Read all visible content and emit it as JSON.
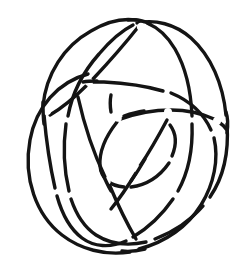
{
  "figure": {
    "kind": "knot-diagram",
    "caption": "",
    "canvas": {
      "width": 244,
      "height": 275,
      "background_color": "#ffffff"
    },
    "style": {
      "stroke_color": "#141414",
      "stroke_width": 3.4,
      "fill": "none",
      "line_cap": "round"
    },
    "bounds": {
      "left": 17,
      "top": 18,
      "right": 228,
      "bottom": 256
    },
    "loop_count": 3,
    "crossing_count": 12,
    "loops": [
      {
        "name": "loop-upper-left",
        "label": "Loop A",
        "center_x": 104,
        "center_y": 128,
        "radius_x": 78,
        "radius_y": 92,
        "rotation_deg": -28
      },
      {
        "name": "loop-right",
        "label": "Loop B",
        "center_x": 136,
        "center_y": 132,
        "radius_x": 80,
        "radius_y": 94,
        "rotation_deg": 32
      },
      {
        "name": "loop-lower",
        "label": "Loop C",
        "center_x": 120,
        "center_y": 150,
        "radius_x": 86,
        "radius_y": 80,
        "rotation_deg": 4
      }
    ],
    "crossings": [
      {
        "name": "crossing-top",
        "x": 141,
        "y": 27,
        "over": "loop-upper-left"
      },
      {
        "name": "crossing-upper-right",
        "x": 196,
        "y": 140,
        "over": "loop-right"
      },
      {
        "name": "crossing-left-upper",
        "x": 46,
        "y": 96,
        "over": "loop-lower"
      },
      {
        "name": "crossing-left-mid",
        "x": 75,
        "y": 92,
        "over": "loop-upper-left"
      },
      {
        "name": "crossing-center-left",
        "x": 86,
        "y": 101,
        "over": "loop-right"
      },
      {
        "name": "crossing-right-mid",
        "x": 176,
        "y": 96,
        "over": "loop-lower"
      },
      {
        "name": "crossing-inner-top",
        "x": 131,
        "y": 146,
        "over": "loop-right"
      },
      {
        "name": "crossing-inner-left",
        "x": 106,
        "y": 172,
        "over": "loop-upper-left"
      },
      {
        "name": "crossing-inner-right",
        "x": 160,
        "y": 176,
        "over": "loop-lower"
      },
      {
        "name": "crossing-bottom-center",
        "x": 133,
        "y": 241,
        "over": "loop-lower"
      },
      {
        "name": "crossing-lower-left",
        "x": 66,
        "y": 196,
        "over": "loop-upper-left"
      },
      {
        "name": "crossing-lower-right",
        "x": 186,
        "y": 206,
        "over": "loop-right"
      }
    ]
  }
}
